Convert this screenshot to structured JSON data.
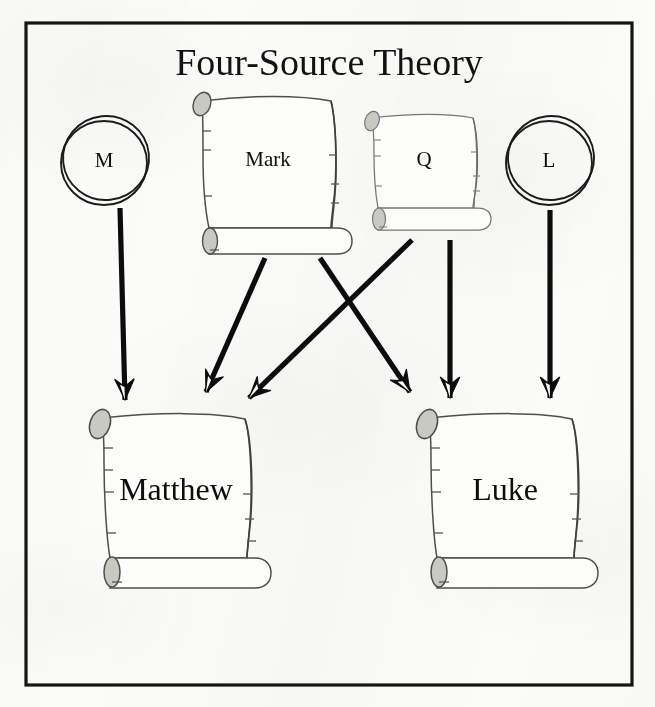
{
  "figure": {
    "title": "Four-Source Theory",
    "frame": {
      "stroke_color": "#151515"
    },
    "background_color": "#fbfbfa"
  },
  "nodes": {
    "sources": [
      {
        "id": "M",
        "label": "M",
        "shape": "circle",
        "cx": 104,
        "cy": 160,
        "rx": 44,
        "ry": 45
      },
      {
        "id": "Mark",
        "label": "Mark",
        "shape": "scroll",
        "x": 190,
        "y": 92,
        "w": 150,
        "h": 150
      },
      {
        "id": "Q",
        "label": "Q",
        "shape": "scroll",
        "x": 364,
        "y": 110,
        "w": 120,
        "h": 110
      },
      {
        "id": "L",
        "label": "L",
        "shape": "circle",
        "cx": 548,
        "cy": 160,
        "rx": 44,
        "ry": 45
      }
    ],
    "gospels": [
      {
        "id": "Matthew",
        "label": "Matthew",
        "shape": "scroll",
        "x": 86,
        "y": 412,
        "w": 194,
        "h": 170
      },
      {
        "id": "Luke",
        "label": "Luke",
        "shape": "scroll",
        "x": 414,
        "y": 412,
        "w": 194,
        "h": 170
      }
    ]
  },
  "edges": [
    {
      "id": "m-to-matthew",
      "from": "M",
      "to": "Matthew",
      "kind": "vertical"
    },
    {
      "id": "mark-to-matthew",
      "from": "Mark",
      "to": "Matthew",
      "kind": "diagonal"
    },
    {
      "id": "q-to-matthew",
      "from": "Q",
      "to": "Matthew",
      "kind": "diagonal"
    },
    {
      "id": "mark-to-luke",
      "from": "Mark",
      "to": "Luke",
      "kind": "diagonal"
    },
    {
      "id": "q-to-luke",
      "from": "Q",
      "to": "Luke",
      "kind": "vertical"
    },
    {
      "id": "l-to-luke",
      "from": "L",
      "to": "Luke",
      "kind": "vertical"
    }
  ],
  "colors": {
    "ink": "#111111",
    "scroll_outline": "#4a4a4a",
    "scroll_fill": "#fcfcfb",
    "curl_fill": "#c9c9c4",
    "arrow": "#0c0c0c"
  }
}
